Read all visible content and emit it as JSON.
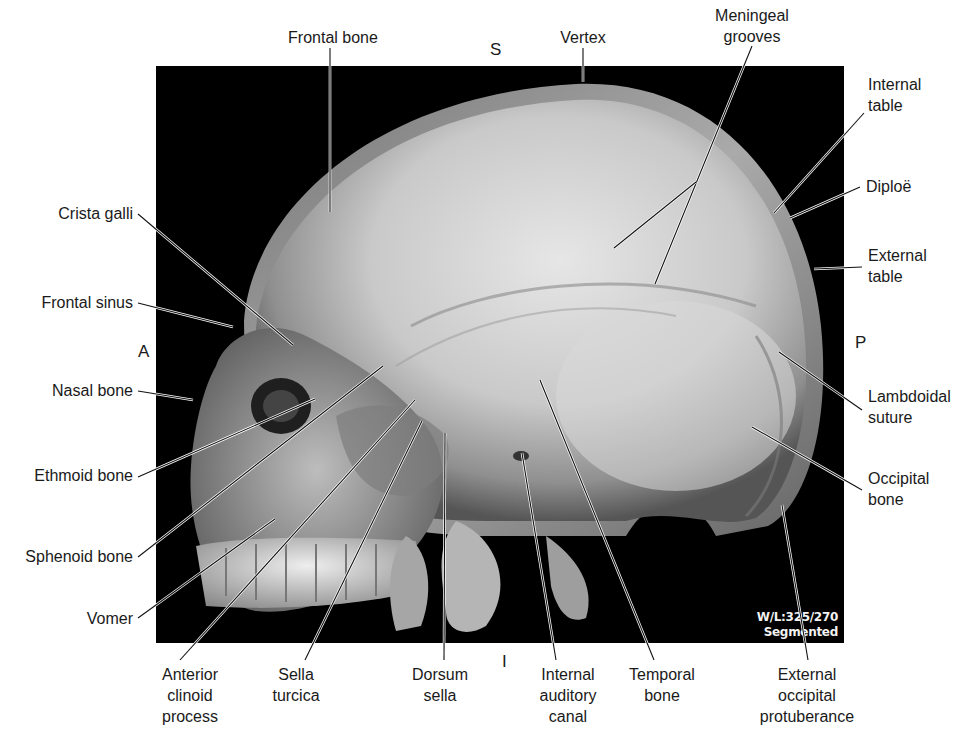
{
  "figure": {
    "frame": {
      "x": 156,
      "y": 66,
      "width": 688,
      "height": 577,
      "background": "#000000"
    },
    "overlay": {
      "window_level": "W/L:325/270",
      "mode": "Segmented"
    },
    "orientation": {
      "superior": {
        "text": "S",
        "x": 490,
        "y": 40
      },
      "inferior": {
        "text": "I",
        "x": 502,
        "y": 652
      },
      "anterior": {
        "text": "A",
        "x": 138,
        "y": 342
      },
      "posterior": {
        "text": "P",
        "x": 855,
        "y": 333
      }
    },
    "labels": [
      {
        "id": "frontal-bone",
        "text": "Frontal bone",
        "align": "center",
        "x": 333,
        "y": 27,
        "line": [
          [
            330,
            48
          ],
          [
            330,
            212
          ]
        ]
      },
      {
        "id": "vertex",
        "text": "Vertex",
        "align": "center",
        "x": 583,
        "y": 27,
        "line": [
          [
            583,
            48
          ],
          [
            583,
            82
          ]
        ]
      },
      {
        "id": "meningeal-grooves",
        "text": "Meningeal\ngrooves",
        "align": "center",
        "x": 752,
        "y": 5,
        "line": [
          [
            752,
            46
          ],
          [
            655,
            284
          ]
        ],
        "branch": [
          [
            696,
            182
          ],
          [
            614,
            248
          ]
        ]
      },
      {
        "id": "internal-table",
        "text": "Internal\ntable",
        "align": "right",
        "x": 868,
        "y": 74,
        "line": [
          [
            864,
            113
          ],
          [
            774,
            213
          ]
        ]
      },
      {
        "id": "diploe",
        "text": "Diploë",
        "align": "right",
        "x": 866,
        "y": 176,
        "line": [
          [
            860,
            187
          ],
          [
            790,
            218
          ]
        ]
      },
      {
        "id": "external-table",
        "text": "External\ntable",
        "align": "right",
        "x": 868,
        "y": 245,
        "line": [
          [
            862,
            267
          ],
          [
            814,
            269
          ]
        ]
      },
      {
        "id": "lambdoidal-suture",
        "text": "Lambdoidal\nsuture",
        "align": "right",
        "x": 868,
        "y": 386,
        "line": [
          [
            862,
            410
          ],
          [
            779,
            352
          ]
        ]
      },
      {
        "id": "occipital-bone",
        "text": "Occipital\nbone",
        "align": "right",
        "x": 868,
        "y": 468,
        "line": [
          [
            862,
            490
          ],
          [
            752,
            427
          ]
        ]
      },
      {
        "id": "external-occipital-protuberance",
        "text": "External\noccipital\nprotuberance",
        "align": "center",
        "x": 807,
        "y": 664,
        "line": [
          [
            808,
            660
          ],
          [
            782,
            505
          ]
        ]
      },
      {
        "id": "temporal-bone",
        "text": "Temporal\nbone",
        "align": "center",
        "x": 662,
        "y": 664,
        "line": [
          [
            654,
            660
          ],
          [
            540,
            380
          ]
        ]
      },
      {
        "id": "internal-auditory-canal",
        "text": "Internal\nauditory\ncanal",
        "align": "center",
        "x": 568,
        "y": 664,
        "line": [
          [
            556,
            660
          ],
          [
            522,
            453
          ]
        ]
      },
      {
        "id": "dorsum-sella",
        "text": "Dorsum\nsella",
        "align": "center",
        "x": 440,
        "y": 664,
        "line": [
          [
            444,
            660
          ],
          [
            445,
            433
          ]
        ]
      },
      {
        "id": "sella-turcica",
        "text": "Sella\nturcica",
        "align": "center",
        "x": 296,
        "y": 664,
        "line": [
          [
            305,
            660
          ],
          [
            422,
            421
          ]
        ]
      },
      {
        "id": "anterior-clinoid-process",
        "text": "Anterior\nclinoid\nprocess",
        "align": "center",
        "x": 190,
        "y": 664,
        "line": [
          [
            180,
            660
          ],
          [
            415,
            400
          ]
        ]
      },
      {
        "id": "crista-galli",
        "text": "Crista galli",
        "align": "left",
        "x": 133,
        "y": 203,
        "line": [
          [
            138,
            214
          ],
          [
            293,
            345
          ]
        ]
      },
      {
        "id": "frontal-sinus",
        "text": "Frontal sinus",
        "align": "left",
        "x": 133,
        "y": 292,
        "line": [
          [
            138,
            303
          ],
          [
            233,
            327
          ]
        ]
      },
      {
        "id": "nasal-bone",
        "text": "Nasal bone",
        "align": "left",
        "x": 133,
        "y": 380,
        "line": [
          [
            138,
            391
          ],
          [
            193,
            400
          ]
        ]
      },
      {
        "id": "ethmoid-bone",
        "text": "Ethmoid bone",
        "align": "left",
        "x": 133,
        "y": 465,
        "line": [
          [
            138,
            477
          ],
          [
            315,
            399
          ]
        ]
      },
      {
        "id": "sphenoid-bone",
        "text": "Sphenoid bone",
        "align": "left",
        "x": 133,
        "y": 546,
        "line": [
          [
            138,
            557
          ],
          [
            383,
            366
          ]
        ]
      },
      {
        "id": "vomer",
        "text": "Vomer",
        "align": "left",
        "x": 133,
        "y": 608,
        "line": [
          [
            138,
            618
          ],
          [
            275,
            519
          ]
        ]
      }
    ]
  }
}
